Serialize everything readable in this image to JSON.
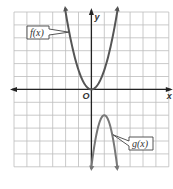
{
  "chart_data": {
    "type": "line",
    "title": "",
    "xlabel": "x",
    "ylabel": "y",
    "origin_label": "O",
    "xlim": [
      -6,
      6
    ],
    "ylim": [
      -6,
      6
    ],
    "grid": true,
    "series": [
      {
        "name": "f(x)",
        "label": "f(x)",
        "color": "#555555",
        "description": "upward parabola, vertex at origin",
        "x": [
          -2,
          -1.5,
          -1,
          -0.5,
          0,
          0.5,
          1,
          1.5,
          2
        ],
        "y": [
          6,
          3.4,
          1.5,
          0.4,
          0,
          0.4,
          1.5,
          3.4,
          6
        ]
      },
      {
        "name": "g(x)",
        "label": "g(x)",
        "color": "#777777",
        "description": "downward parabola, vertex at (1, -2)",
        "x": [
          0,
          0.5,
          1,
          1.5,
          2
        ],
        "y": [
          -6,
          -3,
          -2,
          -3,
          -6
        ]
      }
    ]
  }
}
